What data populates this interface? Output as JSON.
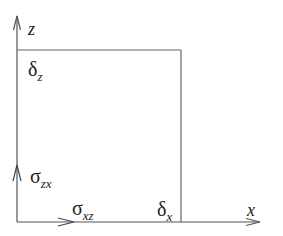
{
  "diagram": {
    "axes": {
      "z_label": "z",
      "x_label": "x"
    },
    "labels": {
      "delta_z": {
        "symbol": "δ",
        "subscript": "z"
      },
      "delta_x": {
        "symbol": "δ",
        "subscript": "x"
      },
      "sigma_zx": {
        "symbol": "σ",
        "subscript": "zx"
      },
      "sigma_xz": {
        "symbol": "σ",
        "subscript": "xz"
      }
    },
    "colors": {
      "line": "#555555",
      "text": "#222222"
    }
  }
}
